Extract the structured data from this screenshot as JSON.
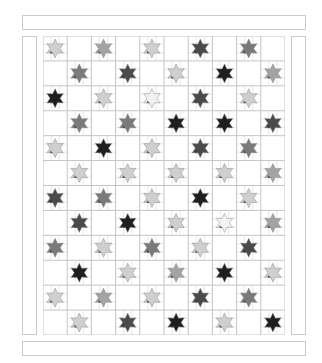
{
  "quilt": {
    "title": "",
    "layout": {
      "columns": 10,
      "rows": 12
    },
    "shades": {
      "black": "#1e1e1e",
      "dark": "#4a4a4a",
      "mid": "#7a7a7a",
      "midlight": "#a3a3a3",
      "light": "#cfcfcf",
      "white": "#f2f2f2"
    },
    "line_color": "#c4c4c4",
    "star_rows": [
      [
        "light",
        "midlight",
        "light",
        "dark",
        "mid"
      ],
      [
        "mid",
        "dark",
        "light",
        "black",
        "midlight"
      ],
      [
        "black",
        "light",
        "white",
        "dark",
        "light"
      ],
      [
        "mid",
        "mid",
        "black",
        "black",
        "dark"
      ],
      [
        "light",
        "black",
        "light",
        "dark",
        "mid"
      ],
      [
        "light",
        "light",
        "light",
        "light",
        "midlight"
      ],
      [
        "dark",
        "mid",
        "light",
        "black",
        "light"
      ],
      [
        "dark",
        "black",
        "light",
        "white",
        "midlight"
      ],
      [
        "mid",
        "light",
        "mid",
        "light",
        "dark"
      ],
      [
        "black",
        "light",
        "midlight",
        "black",
        "light"
      ],
      [
        "light",
        "midlight",
        "light",
        "dark",
        "mid"
      ],
      [
        "light",
        "dark",
        "black",
        "light",
        "black"
      ]
    ]
  }
}
